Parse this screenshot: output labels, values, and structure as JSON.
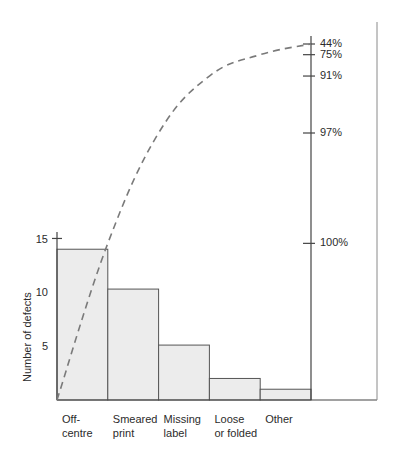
{
  "chart_data": {
    "type": "bar",
    "title": "",
    "subtitle": "",
    "xlabel": "",
    "ylabel": "Number of defects",
    "y2label": "",
    "grid": false,
    "legend": "none",
    "categories": [
      "Off-\ncentre",
      "Smeared\nprint",
      "Missing\nlabel",
      "Loose\nor folded",
      "Other"
    ],
    "category_lines": [
      [
        "Off-",
        "centre"
      ],
      [
        "Smeared",
        "print"
      ],
      [
        "Missing",
        "label"
      ],
      [
        "Loose",
        "or folded"
      ],
      [
        "Other"
      ]
    ],
    "values": [
      14,
      10.3,
      5.1,
      2,
      1
    ],
    "ylim": [
      0,
      15.6
    ],
    "yticks": [
      5,
      10,
      15
    ],
    "ytick_labels": [
      "5",
      "10",
      "15"
    ],
    "series": [
      {
        "name": "Number of defects",
        "type": "bar",
        "values": [
          14,
          10.3,
          5.1,
          2,
          1
        ]
      },
      {
        "name": "Cumulative percentage",
        "type": "line",
        "style": "dashed",
        "values": [
          44,
          75,
          91,
          97,
          100
        ],
        "start_value": 0
      }
    ],
    "y2lim": [
      0,
      100
    ],
    "y2ticks": [
      44,
      75,
      91,
      97,
      100
    ],
    "y2tick_labels": [
      "44%",
      "75%",
      "91%",
      "97%",
      "100%"
    ],
    "colors": {
      "bar_fill": "#ececec",
      "bar_stroke": "#555555",
      "axis": "#444444",
      "curve": "#7a7a7a",
      "text": "#2b2b2b"
    }
  },
  "axes": {
    "left": {
      "title": "Number of defects",
      "ticks": [
        {
          "label": "15",
          "value": 15
        },
        {
          "label": "10",
          "value": 10
        },
        {
          "label": "5",
          "value": 5
        }
      ]
    },
    "right": {
      "ticks": [
        {
          "label": "100%",
          "value": 100
        },
        {
          "label": "97%",
          "value": 97
        },
        {
          "label": "91%",
          "value": 91
        },
        {
          "label": "75%",
          "value": 75
        },
        {
          "label": "44%",
          "value": 44
        }
      ]
    }
  },
  "categories": [
    {
      "line1": "Off-",
      "line2": "centre"
    },
    {
      "line1": "Smeared",
      "line2": "print"
    },
    {
      "line1": "Missing",
      "line2": "label"
    },
    {
      "line1": "Loose",
      "line2": "or folded"
    },
    {
      "line1": "Other",
      "line2": ""
    }
  ]
}
